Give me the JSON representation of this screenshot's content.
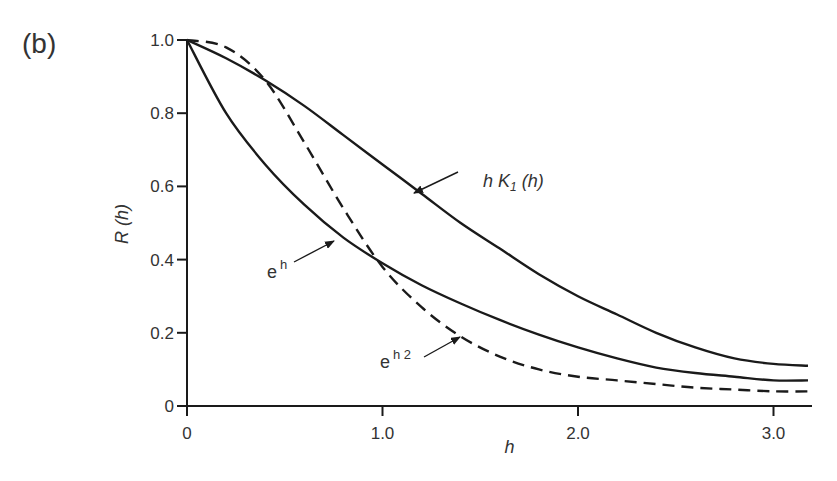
{
  "panel_label": "(b)",
  "chart_data": {
    "type": "line",
    "title": "",
    "xlabel": "h",
    "ylabel": "R (h)",
    "xlim": [
      0,
      3.2
    ],
    "ylim": [
      0,
      1.0
    ],
    "grid": false,
    "legend": "none (inline arrow annotations)",
    "x_ticks": [
      0,
      1.0,
      2.0,
      3.0
    ],
    "x_tick_labels": [
      "0",
      "1.0",
      "2.0",
      "3.0"
    ],
    "y_ticks": [
      0,
      0.2,
      0.4,
      0.6,
      0.8,
      1.0
    ],
    "y_tick_labels": [
      "0",
      "0.2",
      "0.4",
      "0.6",
      "0.8",
      "1.0"
    ],
    "x": [
      0,
      0.2,
      0.4,
      0.6,
      0.8,
      1.0,
      1.2,
      1.4,
      1.6,
      1.8,
      2.0,
      2.2,
      2.4,
      2.6,
      2.8,
      3.0,
      3.2
    ],
    "series": [
      {
        "name": "h K1(h)",
        "style": "solid",
        "values": [
          1.0,
          0.95,
          0.89,
          0.82,
          0.74,
          0.66,
          0.58,
          0.5,
          0.43,
          0.36,
          0.3,
          0.25,
          0.2,
          0.16,
          0.13,
          0.115,
          0.11
        ]
      },
      {
        "name": "e^h",
        "style": "solid",
        "values": [
          1.0,
          0.8,
          0.66,
          0.55,
          0.46,
          0.39,
          0.33,
          0.28,
          0.235,
          0.195,
          0.16,
          0.13,
          0.105,
          0.09,
          0.08,
          0.07,
          0.07
        ]
      },
      {
        "name": "e^h2",
        "style": "dashed",
        "values": [
          1.0,
          0.98,
          0.89,
          0.72,
          0.54,
          0.38,
          0.27,
          0.19,
          0.135,
          0.1,
          0.08,
          0.07,
          0.06,
          0.05,
          0.045,
          0.04,
          0.04
        ]
      }
    ],
    "annotations": [
      {
        "text_base": "h K",
        "text_sub": "1",
        "text_tail": " (h)",
        "points_to_series": "h K1(h)",
        "arrow_tip": [
          1.2,
          0.6
        ]
      },
      {
        "text_base": "e",
        "text_sup": "h",
        "points_to_series": "e^h",
        "arrow_tip": [
          0.77,
          0.47
        ]
      },
      {
        "text_base": "e",
        "text_sup": "h 2",
        "points_to_series": "e^h2",
        "arrow_tip": [
          1.5,
          0.17
        ]
      }
    ]
  }
}
